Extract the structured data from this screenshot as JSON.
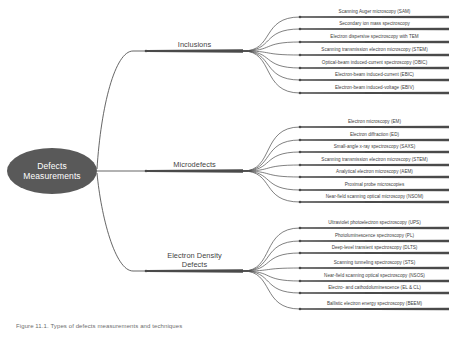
{
  "diagram": {
    "type": "mind-map",
    "root": {
      "label_line1": "Defects",
      "label_line2": "Measurements",
      "shape": "ellipse",
      "fill_color": "#595959",
      "text_color": "#ffffff"
    },
    "branches": [
      {
        "label": "Inclusions",
        "label_line1": "Inclusions",
        "label_line2": "",
        "color": "#4a4a4a",
        "leaves": [
          "Scanning Auger microscopy (SAM)",
          "Secondary ion mass spectroscopy",
          "Electron dispersive spectroscopy with TEM",
          "Scanning transmission electron microscopy (STEM)",
          "Optical-beam induced-current spectroscopy (OBIC)",
          "Electron-beam induced-current (EBIC)",
          "Electron-beam induced-voltage (EBIV)"
        ]
      },
      {
        "label": "Microdefects",
        "label_line1": "Microdefects",
        "label_line2": "",
        "color": "#4a4a4a",
        "leaves": [
          "Electron microscopy (EM)",
          "Electron diffraction (ED)",
          "Small-angle x-ray spectroscopy (SAXS)",
          "Scanning transmission electron microscopy (STEM)",
          "Analytical electron microscopy (AEM)",
          "Proximal probe microscopies",
          "Near-field scanning optical microscopy (NSOM)"
        ]
      },
      {
        "label": "Electron Density Defects",
        "label_line1": "Electron Density",
        "label_line2": "Defects",
        "color": "#4a4a4a",
        "leaves": [
          "Ultraviolet photoelectron spectroscopy (UPS)",
          "Photoluminescence spectroscopy (PL)",
          "Deep-level transient spectroscopy (DLTS)",
          "Scanning tunneling spectroscopy (STS)",
          "Near-field scanning optical spectroscopy (NSOS)",
          "Electro- and cathodoluminescence (EL & CL)",
          "Ballistic electron energy spectroscopy (BEEM)"
        ]
      }
    ]
  },
  "caption": {
    "text": "Figure 11.1. Types of defects measurements and techniques"
  },
  "colors": {
    "root_fill": "#595959",
    "line": "#4a4a4a",
    "text": "#3d3d3d",
    "caption": "#6d6d6d",
    "background": "#ffffff"
  }
}
